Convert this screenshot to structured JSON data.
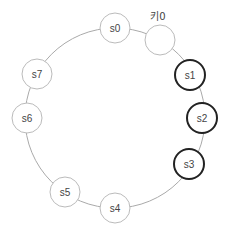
{
  "diagram": {
    "type": "consistent-hashing-ring",
    "ring": {
      "cx": 115,
      "cy": 118,
      "r": 90,
      "stroke": "#aaaaaa"
    },
    "servers": [
      {
        "id": "s0",
        "label": "s0",
        "cx": 115,
        "cy": 28,
        "highlighted": false
      },
      {
        "id": "s1",
        "label": "s1",
        "cx": 190,
        "cy": 75,
        "highlighted": true
      },
      {
        "id": "s2",
        "label": "s2",
        "cx": 202,
        "cy": 118,
        "highlighted": true
      },
      {
        "id": "s3",
        "label": "s3",
        "cx": 189,
        "cy": 164,
        "highlighted": true
      },
      {
        "id": "s4",
        "label": "s4",
        "cx": 115,
        "cy": 208,
        "highlighted": false
      },
      {
        "id": "s5",
        "label": "s5",
        "cx": 65,
        "cy": 192,
        "highlighted": false
      },
      {
        "id": "s6",
        "label": "s6",
        "cx": 27,
        "cy": 118,
        "highlighted": false
      },
      {
        "id": "s7",
        "label": "s7",
        "cx": 37,
        "cy": 74,
        "highlighted": false
      }
    ],
    "key": {
      "label": "키0",
      "cx": 160,
      "cy": 40,
      "label_x": 158,
      "label_y": 20
    },
    "colors": {
      "node_fill": "#ffffff",
      "node_stroke": "#bbbbbb",
      "highlight_stroke": "#222222",
      "text": "#444444"
    }
  }
}
